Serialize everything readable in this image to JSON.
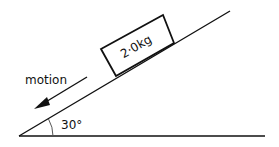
{
  "diagram": {
    "type": "inclined-plane",
    "block_label": "2·0kg",
    "motion_label": "motion",
    "angle_label": "30°",
    "angle_degrees": 30,
    "line_color": "#111111",
    "background": "#ffffff"
  }
}
